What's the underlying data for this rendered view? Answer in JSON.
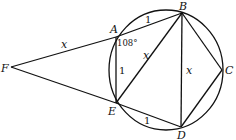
{
  "diagram": {
    "points": {
      "F": {
        "label": "F",
        "x": 11,
        "y": 67
      },
      "A": {
        "label": "A",
        "x": 116,
        "y": 37
      },
      "B": {
        "label": "B",
        "x": 182,
        "y": 13
      },
      "C": {
        "label": "C",
        "x": 222,
        "y": 70
      },
      "D": {
        "label": "D",
        "x": 181,
        "y": 127
      },
      "E": {
        "label": "E",
        "x": 116,
        "y": 103
      }
    },
    "circle": {
      "cx": 167,
      "cy": 70,
      "r": 58
    },
    "segment_labels": {
      "FA": "x",
      "AB": "1",
      "AE": "1",
      "EB": "x",
      "BD": "x",
      "ED": "1"
    },
    "angle_label": "108°"
  }
}
